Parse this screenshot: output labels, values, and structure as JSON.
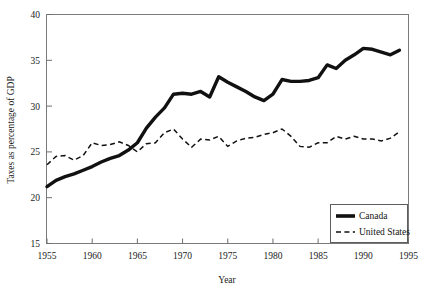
{
  "chart_data": {
    "type": "line",
    "title": "",
    "xlabel": "Year",
    "ylabel": "Taxes as percentage of GDP",
    "xlim": [
      1955,
      1995
    ],
    "ylim": [
      15,
      40
    ],
    "xticks": [
      1955,
      1960,
      1965,
      1970,
      1975,
      1980,
      1985,
      1990,
      1995
    ],
    "yticks": [
      15,
      20,
      25,
      30,
      35,
      40
    ],
    "xtick_labels": [
      "1955",
      "1960",
      "1965",
      "1970",
      "1975",
      "1980",
      "1985",
      "1990",
      "1995"
    ],
    "ytick_labels": [
      "15",
      "20",
      "25",
      "30",
      "35",
      "40"
    ],
    "grid": false,
    "legend_position": "lower-right",
    "x": [
      1955,
      1956,
      1957,
      1958,
      1959,
      1960,
      1961,
      1962,
      1963,
      1964,
      1965,
      1966,
      1967,
      1968,
      1969,
      1970,
      1971,
      1972,
      1973,
      1974,
      1975,
      1976,
      1977,
      1978,
      1979,
      1980,
      1981,
      1982,
      1983,
      1984,
      1985,
      1986,
      1987,
      1988,
      1989,
      1990,
      1991,
      1992,
      1993,
      1994
    ],
    "series": [
      {
        "name": "Canada",
        "style": "solid-thick",
        "color": "#111111",
        "values": [
          21.2,
          21.9,
          22.3,
          22.6,
          23.0,
          23.4,
          23.9,
          24.3,
          24.6,
          25.2,
          26.0,
          27.6,
          28.8,
          29.8,
          31.3,
          31.4,
          31.3,
          31.6,
          31.0,
          33.2,
          32.6,
          32.1,
          31.6,
          31.0,
          30.6,
          31.3,
          32.9,
          32.7,
          32.7,
          32.8,
          33.1,
          34.5,
          34.1,
          35.0,
          35.6,
          36.3,
          36.2,
          35.9,
          35.6,
          36.1
        ]
      },
      {
        "name": "United States",
        "style": "dashed",
        "color": "#111111",
        "values": [
          23.6,
          24.5,
          24.6,
          24.1,
          24.6,
          26.0,
          25.7,
          25.8,
          26.1,
          25.7,
          25.0,
          25.9,
          26.0,
          27.1,
          27.5,
          26.4,
          25.5,
          26.4,
          26.3,
          26.7,
          25.6,
          26.2,
          26.5,
          26.6,
          26.9,
          27.1,
          27.5,
          26.7,
          25.6,
          25.5,
          26.0,
          26.0,
          26.7,
          26.4,
          26.7,
          26.4,
          26.4,
          26.2,
          26.5,
          27.2
        ]
      }
    ],
    "legend": [
      {
        "label": "Canada",
        "style": "solid-thick"
      },
      {
        "label": "United States",
        "style": "dashed"
      }
    ]
  }
}
